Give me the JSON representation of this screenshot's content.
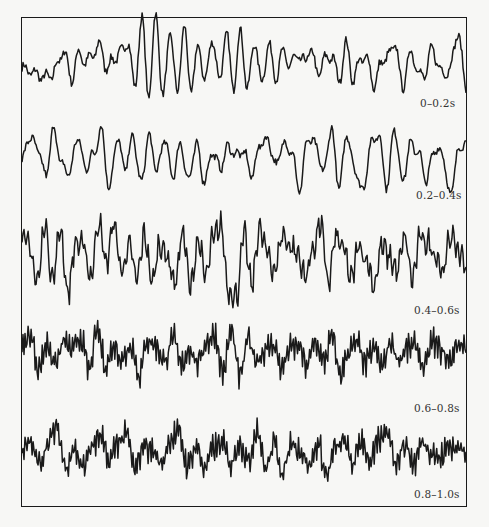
{
  "figure": {
    "frame_color": "#1a1a1a",
    "background": "#f7f7f5"
  },
  "labels": [
    "0–0.2s",
    "0.2–0.4s",
    "0.4–0.6s",
    "0.6–0.8s",
    "0.8–1.0s"
  ],
  "chart_data": {
    "type": "line",
    "title": "",
    "xlabel": "",
    "ylabel": "",
    "grid": false,
    "legend": "none",
    "series": [
      {
        "name": "0–0.2s",
        "baseline_y": 68,
        "amplitude": 30,
        "cycles": 18,
        "noise": 0.25,
        "values": [
          0.0,
          -0.1,
          -0.2,
          -0.3,
          -0.3,
          0.1,
          0.6,
          -0.4,
          0.5,
          0.2,
          0.4,
          0.8,
          0.0,
          0.3,
          0.5,
          0.9,
          -0.6,
          1.6,
          -0.9,
          1.8,
          -1.0,
          1.2,
          -0.8,
          1.3,
          -0.7,
          0.7,
          -0.4,
          1.0,
          -0.4,
          1.1,
          -0.6,
          1.2,
          -0.7,
          0.9,
          -0.5,
          0.8,
          -0.3,
          0.5,
          0.1,
          0.4,
          0.2,
          0.6,
          -0.2,
          0.3,
          0.4,
          -0.4,
          0.8,
          -0.4,
          0.3,
          0.3,
          -0.6,
          0.2,
          0.4,
          0.8,
          -0.7,
          0.5,
          0.1,
          -0.4,
          0.6,
          0.2,
          -0.3,
          0.3,
          1.2,
          -0.8
        ]
      },
      {
        "name": "0.2–0.4s",
        "baseline_y": 160,
        "amplitude": 26,
        "cycles": 20,
        "noise": 0.25,
        "values": [
          0.0,
          0.9,
          0.4,
          -0.6,
          1.2,
          -0.2,
          -0.5,
          0.9,
          -0.3,
          0.2,
          1.2,
          -1.1,
          0.8,
          -0.3,
          0.9,
          -0.9,
          0.9,
          -0.4,
          0.8,
          -0.6,
          0.6,
          -0.8,
          0.6,
          -0.8,
          0.3,
          -0.3,
          0.5,
          0.2,
          0.3,
          -0.6,
          0.6,
          0.8,
          -0.2,
          0.6,
          0.4,
          -1.2,
          0.8,
          0.6,
          -0.5,
          1.2,
          -1.0,
          1.0,
          -0.4,
          -1.2,
          0.6,
          1.0,
          -1.0,
          1.2,
          -0.8,
          0.6,
          0.3,
          -0.8,
          0.4,
          0.3,
          -1.4,
          0.3,
          0.8
        ]
      },
      {
        "name": "0.4–0.6s",
        "baseline_y": 260,
        "amplitude": 28,
        "cycles": 40,
        "noise": 0.55,
        "values": [
          0.9,
          0.4,
          -0.8,
          1.3,
          -0.7,
          1.1,
          -1.2,
          0.6,
          0.5,
          -0.6,
          1.4,
          -0.1,
          1.3,
          -0.4,
          0.5,
          -0.7,
          0.9,
          -0.8,
          0.6,
          0.1,
          -0.8,
          1.0,
          -1.0,
          0.7,
          -0.6,
          0.8,
          1.2,
          -1.1,
          -1.3,
          0.9,
          -0.9,
          1.1,
          0.3,
          -0.4,
          0.9,
          0.5,
          0.2,
          -0.6,
          0.4,
          1.3,
          -0.8,
          0.8,
          0.4,
          -0.7,
          0.5,
          0.0,
          -0.9,
          0.5,
          0.1,
          -0.4,
          0.8,
          -0.7,
          0.8,
          0.6,
          0.2,
          -0.4,
          0.9,
          0.3,
          -0.1
        ]
      },
      {
        "name": "0.6–0.8s",
        "baseline_y": 355,
        "amplitude": 22,
        "cycles": 70,
        "noise": 0.7,
        "values": [
          0.3,
          0.9,
          -0.6,
          0.5,
          -0.4,
          0.6,
          0.2,
          0.8,
          -0.7,
          1.1,
          -0.5,
          0.4,
          -0.2,
          0.5,
          -0.9,
          0.7,
          0.4,
          -0.3,
          0.8,
          -0.5,
          0.3,
          -0.4,
          0.6,
          0.9,
          -0.8,
          1.1,
          -1.0,
          0.7,
          -0.2,
          0.2,
          0.5,
          -0.6,
          0.3,
          0.4,
          -0.5,
          0.6,
          -0.3,
          0.8,
          -0.9,
          0.2,
          0.5,
          -0.4,
          0.3,
          -0.5,
          0.6,
          -0.2,
          0.3,
          0.4,
          -0.6,
          0.6,
          0.2,
          -0.3,
          0.5,
          0.4
        ]
      },
      {
        "name": "0.8–1.0s",
        "baseline_y": 455,
        "amplitude": 22,
        "cycles": 70,
        "noise": 0.7,
        "values": [
          0.2,
          0.5,
          -0.4,
          0.6,
          1.2,
          -0.5,
          0.3,
          -0.6,
          0.4,
          0.8,
          -0.3,
          0.6,
          0.9,
          -0.7,
          0.5,
          0.2,
          -0.4,
          0.7,
          1.0,
          -0.5,
          0.4,
          -0.6,
          0.3,
          0.5,
          -0.4,
          0.6,
          -0.3,
          1.2,
          -0.6,
          0.5,
          -0.8,
          0.6,
          0.2,
          -0.5,
          0.5,
          -0.9,
          0.3,
          0.6,
          -0.4,
          0.7,
          -0.3,
          0.6,
          1.1,
          -0.3,
          0.5,
          -0.4,
          0.6,
          0.2,
          -0.2,
          0.4,
          0.3,
          0.2
        ]
      }
    ],
    "x_range": [
      0,
      1.0
    ],
    "segment_duration_s": 0.2
  }
}
